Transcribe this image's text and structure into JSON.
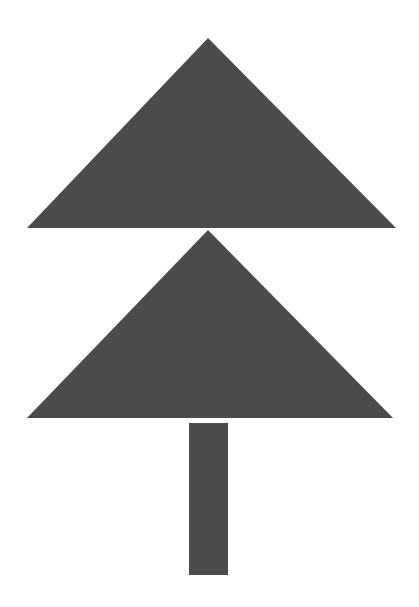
{
  "figure": {
    "fill_color": "#4b4b4b",
    "background_color": "#ffffff",
    "shapes": {
      "top_triangle": {
        "points": "208,38 27,228 396,228"
      },
      "bottom_triangle": {
        "points": "208,230 27,418 393,418"
      },
      "trunk": {
        "x": 189,
        "y": 423,
        "width": 39,
        "height": 152
      }
    }
  }
}
